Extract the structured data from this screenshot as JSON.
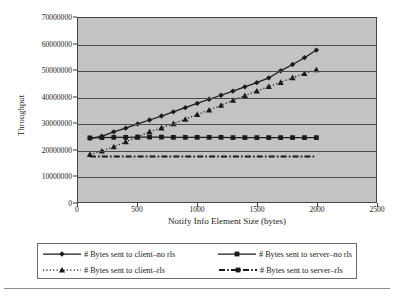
{
  "chart_data": {
    "type": "line",
    "title": "",
    "xlabel": "Notify Info Element Size (bytes)",
    "ylabel": "Throughput",
    "xlim": [
      0,
      2500
    ],
    "ylim": [
      0,
      70000000
    ],
    "xticks": [
      "0",
      "500",
      "1000",
      "1500",
      "2000",
      "2500"
    ],
    "xtick_values": [
      0,
      500,
      1000,
      1500,
      2000,
      2500
    ],
    "yticks": [
      "0",
      "10000000",
      "20000000",
      "30000000",
      "40000000",
      "50000000",
      "60000000",
      "70000000"
    ],
    "ytick_values": [
      0,
      10000000,
      20000000,
      30000000,
      40000000,
      50000000,
      60000000,
      70000000
    ],
    "grid": true,
    "legend_position": "bottom",
    "x": [
      100,
      200,
      300,
      400,
      500,
      600,
      700,
      800,
      900,
      1000,
      1100,
      1200,
      1300,
      1400,
      1500,
      1600,
      1700,
      1800,
      1900,
      2000
    ],
    "series": [
      {
        "name": "# Bytes sent to client-no rls",
        "marker": "diamond",
        "line_style": "solid",
        "color": "#1a1a1a",
        "values": [
          24200000,
          25000000,
          26700000,
          28100000,
          29700000,
          31200000,
          32700000,
          34300000,
          35900000,
          37500000,
          39100000,
          40600000,
          42200000,
          43800000,
          45400000,
          47200000,
          49900000,
          52300000,
          54900000,
          57800000
        ]
      },
      {
        "name": "# Bytes sent to server-no rls",
        "marker": "square",
        "line_style": "solid",
        "color": "#1a1a1a",
        "values": [
          24400000,
          24500000,
          24600000,
          24600000,
          24700000,
          24700000,
          24700000,
          24600000,
          24600000,
          24600000,
          24600000,
          24600000,
          24500000,
          24500000,
          24500000,
          24500000,
          24500000,
          24500000,
          24500000,
          24500000
        ]
      },
      {
        "name": "# Bytes sent to client-rls",
        "marker": "triangle",
        "line_style": "dotted",
        "color": "#1a1a1a",
        "values": [
          18100000,
          19400000,
          21000000,
          22900000,
          24700000,
          26700000,
          28200000,
          29800000,
          31500000,
          33300000,
          35000000,
          36800000,
          38700000,
          40500000,
          42200000,
          43900000,
          45500000,
          47300000,
          48900000,
          50300000
        ]
      },
      {
        "name": "# Bytes sent to server-rls",
        "marker": "none",
        "line_style": "dashdot",
        "color": "#1a1a1a",
        "values": [
          17300000,
          17300000,
          17300000,
          17300000,
          17300000,
          17300000,
          17300000,
          17300000,
          17300000,
          17300000,
          17300000,
          17300000,
          17300000,
          17300000,
          17300000,
          17300000,
          17300000,
          17300000,
          17300000,
          17300000
        ]
      }
    ]
  },
  "legend": {
    "entries": [
      {
        "label": "# Bytes sent to client–no rls",
        "key": "diamond-solid"
      },
      {
        "label": "# Bytes sent to server–no rls",
        "key": "square-solid"
      },
      {
        "label": "# Bytes sent to client–rls",
        "key": "triangle-dotted"
      },
      {
        "label": "# Bytes sent to server–rls",
        "key": "dashdot"
      }
    ]
  },
  "colors": {
    "plot_background": "#c3c3c3",
    "grid": "#4a4a4a",
    "axis": "#444444",
    "series": "#1a1a1a",
    "page_background": "#ffffff"
  }
}
